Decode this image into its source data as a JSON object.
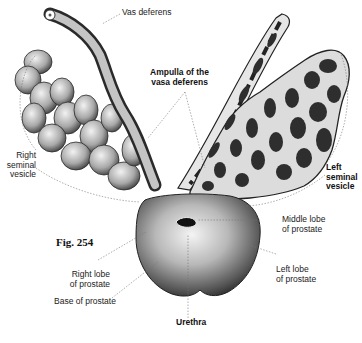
{
  "figure": {
    "number_label": "Fig. 254"
  },
  "labels": {
    "vas_deferens": "Vas deferens",
    "ampulla": "Ampulla of the\nvasa deferens",
    "right_seminal_vesicle": "Right\nseminal\nvesicle",
    "left_seminal_vesicle": "Left\nseminal\nvesicle",
    "middle_lobe": "Middle lobe\nof prostate",
    "left_lobe": "Left lobe\nof prostate",
    "right_lobe": "Right lobe\nof prostate",
    "base_of_prostate": "Base of prostate",
    "urethra": "Urethra"
  },
  "colors": {
    "ink": "#1a1a1a",
    "shade_dark": "#3a3a3a",
    "shade_mid": "#8a8a8a",
    "shade_light": "#d8d8d8",
    "leader_line": "#777777"
  }
}
